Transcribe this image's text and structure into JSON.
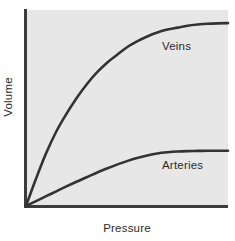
{
  "figure": {
    "background_color": "#ffffff",
    "plot_background_color": "#e7e7e7",
    "axis_color": "#3c3c3c",
    "curve_color": "#333333"
  },
  "chart_data": {
    "type": "line",
    "title": "",
    "subtitle": "",
    "xlabel": "Pressure",
    "ylabel": "Volume",
    "xlim": [
      0,
      100
    ],
    "ylim": [
      0,
      100
    ],
    "grid": false,
    "xticks": [],
    "yticks": [],
    "xticklabels": [],
    "yticklabels": [],
    "legend_position": "inline-annotation",
    "annotations": [
      {
        "text": "Veins",
        "x": 67,
        "y": 78
      },
      {
        "text": "Arteries",
        "x": 67,
        "y": 22
      }
    ],
    "series": [
      {
        "name": "Veins",
        "label": "Veins",
        "x": [
          0,
          5,
          10,
          15,
          20,
          25,
          30,
          35,
          40,
          45,
          50,
          55,
          60,
          65,
          70,
          75,
          80,
          85,
          90,
          95,
          100
        ],
        "values": [
          0,
          14,
          27,
          38,
          47,
          55,
          62,
          68,
          73,
          77,
          81,
          84,
          86.5,
          88.5,
          90,
          91,
          92,
          92.6,
          93,
          93.2,
          93.3
        ]
      },
      {
        "name": "Arteries",
        "label": "Arteries",
        "x": [
          0,
          5,
          10,
          15,
          20,
          25,
          30,
          35,
          40,
          45,
          50,
          55,
          60,
          65,
          70,
          75,
          80,
          85,
          90,
          95,
          100
        ],
        "values": [
          0,
          2.5,
          5,
          7.5,
          10,
          12.4,
          14.7,
          17,
          19.1,
          21.1,
          22.9,
          24.5,
          25.8,
          26.8,
          27.4,
          27.8,
          28,
          28.1,
          28.2,
          28.2,
          28.2
        ]
      }
    ]
  },
  "labels": {
    "y_axis_title": "Volume",
    "x_axis_title": "Pressure",
    "veins": "Veins",
    "arteries": "Arteries"
  }
}
